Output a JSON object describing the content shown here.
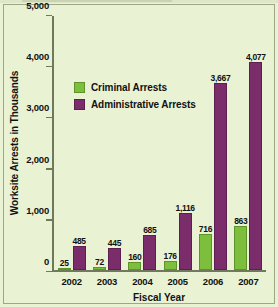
{
  "chart_data": {
    "type": "bar",
    "title": "",
    "xlabel": "Fiscal Year",
    "ylabel": "Worksite Arrests in Thousands",
    "categories": [
      "2002",
      "2003",
      "2004",
      "2005",
      "2006",
      "2007"
    ],
    "series": [
      {
        "name": "Criminal Arrests",
        "color": "#7dbe3c",
        "values": [
          25,
          72,
          160,
          176,
          716,
          863
        ],
        "labels": [
          "25",
          "72",
          "160",
          "176",
          "716",
          "863"
        ]
      },
      {
        "name": "Administrative Arrests",
        "color": "#7b2d6b",
        "values": [
          485,
          445,
          685,
          1116,
          3667,
          4077
        ],
        "labels": [
          "485",
          "445",
          "685",
          "1,116",
          "3,667",
          "4,077"
        ]
      }
    ],
    "ylim": [
      0,
      5000
    ],
    "yticks": [
      0,
      1000,
      2000,
      3000,
      4000,
      5000
    ],
    "ytick_labels": [
      "0",
      "1,000",
      "2,000",
      "3,000",
      "4,000",
      "5,000"
    ],
    "grid": false,
    "legend_position": "upper-left-inside"
  },
  "colors": {
    "background": "#eaf2d4",
    "axis": "#6f7a5c",
    "frame": "#9aa883",
    "criminal": "#7dbe3c",
    "administrative": "#7b2d6b",
    "text": "#111111"
  }
}
